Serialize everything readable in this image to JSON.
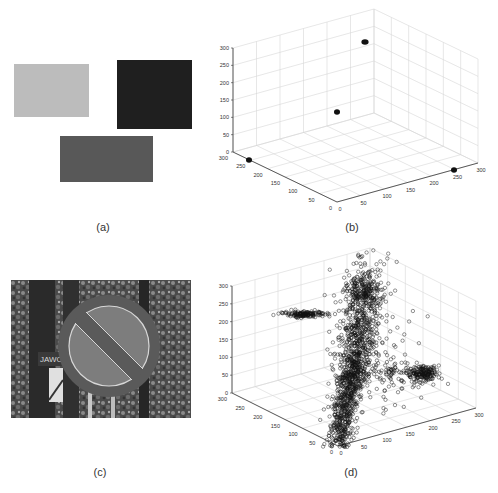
{
  "figure": {
    "captions": {
      "a": "(a)",
      "b": "(b)",
      "c": "(c)",
      "d": "(d)"
    },
    "panel_a": {
      "description": "Three uniform color patches",
      "patches": [
        {
          "name": "light-patch",
          "x": 14,
          "y": 64,
          "w": 75,
          "h": 53,
          "color": "#bcbcbc"
        },
        {
          "name": "dark-patch",
          "x": 117,
          "y": 60,
          "w": 75,
          "h": 69,
          "color": "#1f1f1f"
        },
        {
          "name": "mid-patch",
          "x": 60,
          "y": 136,
          "w": 93,
          "h": 46,
          "color": "#585858"
        }
      ]
    },
    "panel_c": {
      "description": "Photo of a no-parking road sign in front of trees",
      "sign_text": "JAWO"
    }
  },
  "chart_data": [
    {
      "type": "scatter",
      "panel": "b",
      "title": "",
      "projection": "3d",
      "axes": {
        "x": {
          "ticks": [
            0,
            50,
            100,
            150,
            200,
            250,
            300
          ],
          "range": [
            0,
            300
          ]
        },
        "y": {
          "ticks": [
            0,
            50,
            100,
            150,
            200,
            250,
            300
          ],
          "range": [
            0,
            300
          ]
        },
        "z": {
          "ticks": [
            0,
            50,
            100,
            150,
            200,
            250,
            300
          ],
          "range": [
            0,
            300
          ]
        }
      },
      "grid": true,
      "points": [
        {
          "x": 0,
          "y": 0,
          "z": 255,
          "label": "cluster-top"
        },
        {
          "x": 0,
          "y": 0,
          "z": 110,
          "label": "cluster-middle"
        },
        {
          "x": 0,
          "y": 260,
          "z": 0,
          "label": "cluster-left"
        },
        {
          "x": 260,
          "y": 0,
          "z": 0,
          "label": "cluster-right"
        }
      ]
    },
    {
      "type": "scatter",
      "panel": "d",
      "title": "",
      "projection": "3d",
      "marker": "open-circle",
      "axes": {
        "x": {
          "ticks": [
            0,
            50,
            100,
            150,
            200,
            250,
            300
          ],
          "range": [
            0,
            300
          ]
        },
        "y": {
          "ticks": [
            0,
            50,
            100,
            150,
            200,
            250,
            300
          ],
          "range": [
            0,
            300
          ]
        },
        "z": {
          "ticks": [
            0,
            50,
            100,
            150,
            200,
            250,
            300
          ],
          "range": [
            0,
            300
          ]
        }
      },
      "grid": true,
      "clusters": [
        {
          "name": "dense-vertical-column",
          "cx": 349,
          "cy": 390,
          "sx": 7,
          "sy": 42,
          "n": 900,
          "tilt": 0.18
        },
        {
          "name": "column-upper-spread",
          "cx": 360,
          "cy": 320,
          "sx": 10,
          "sy": 38,
          "n": 320,
          "tilt": 0.12
        },
        {
          "name": "top-cluster",
          "cx": 365,
          "cy": 292,
          "sx": 9,
          "sy": 8,
          "n": 160,
          "tilt": 0
        },
        {
          "name": "left-horizontal-cluster",
          "cx": 305,
          "cy": 314,
          "sx": 10,
          "sy": 1.5,
          "n": 140,
          "tilt": 0
        },
        {
          "name": "right-cluster",
          "cx": 423,
          "cy": 373,
          "sx": 7,
          "sy": 4,
          "n": 160,
          "tilt": 0
        },
        {
          "name": "bridge-to-right",
          "cx": 395,
          "cy": 375,
          "sx": 16,
          "sy": 7,
          "n": 90,
          "tilt": 0
        },
        {
          "name": "sparse-scatter",
          "cx": 372,
          "cy": 345,
          "sx": 22,
          "sy": 35,
          "n": 120,
          "tilt": 0
        }
      ]
    }
  ]
}
